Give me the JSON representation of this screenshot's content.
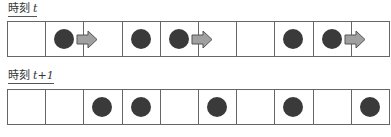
{
  "diagram": {
    "rows": [
      {
        "label_prefix": "時刻",
        "label_var": "t",
        "cells": 10,
        "occupied": [
          2,
          4,
          5,
          8,
          9
        ],
        "moving": [
          2,
          5,
          9
        ]
      },
      {
        "label_prefix": "時刻",
        "label_var": "t+1",
        "cells": 10,
        "occupied": [
          3,
          4,
          6,
          8,
          10
        ],
        "moving": []
      }
    ],
    "colors": {
      "car": "#3a3a3a",
      "arrow_fill": "#a0a0a0",
      "arrow_stroke": "#555555",
      "grid": "#666666"
    }
  }
}
